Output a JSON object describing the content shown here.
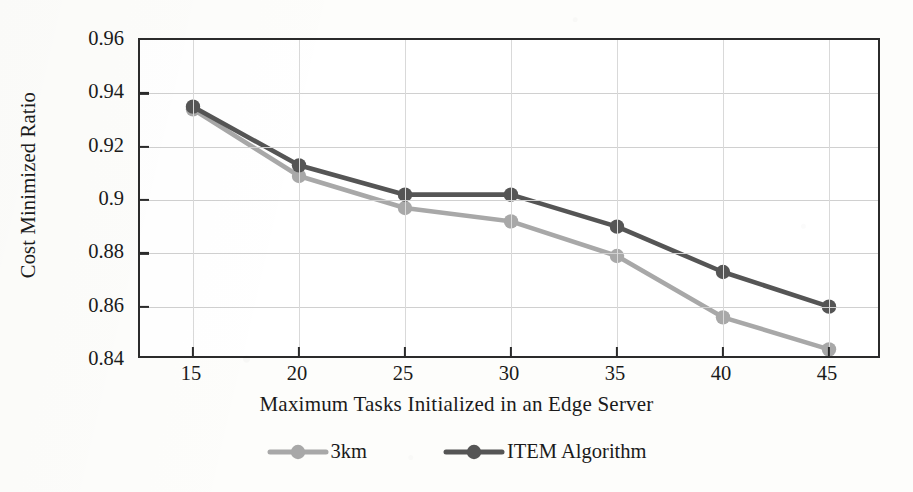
{
  "chart_data": {
    "type": "line",
    "title": "",
    "xlabel": "Maximum Tasks Initialized in an Edge Server",
    "ylabel": "Cost Minimized Ratio",
    "x": [
      15,
      20,
      25,
      30,
      35,
      40,
      45
    ],
    "xticklabels": [
      "15",
      "20",
      "25",
      "30",
      "35",
      "40",
      "45"
    ],
    "yticklabels": [
      "0.84",
      "0.86",
      "0.88",
      "0.9",
      "0.92",
      "0.94",
      "0.96"
    ],
    "yticks": [
      0.84,
      0.86,
      0.88,
      0.9,
      0.92,
      0.94,
      0.96
    ],
    "xlim": [
      12.5,
      47.5
    ],
    "ylim": [
      0.84,
      0.96
    ],
    "grid": "horizontal-and-vertical",
    "legend_position": "below-axis-center",
    "series": [
      {
        "name": "3km",
        "color": "#a8a8a8",
        "marker": "circle",
        "values": [
          0.934,
          0.909,
          0.897,
          0.892,
          0.879,
          0.856,
          0.844
        ]
      },
      {
        "name": "ITEM Algorithm",
        "color": "#555555",
        "marker": "circle",
        "values": [
          0.935,
          0.913,
          0.902,
          0.902,
          0.89,
          0.873,
          0.86
        ]
      }
    ]
  },
  "legend": {
    "items": [
      {
        "label": "3km",
        "color": "#a8a8a8"
      },
      {
        "label": "ITEM Algorithm",
        "color": "#555555"
      }
    ]
  },
  "colors": {
    "series_light": "#a8a8a8",
    "series_dark": "#555555",
    "axis": "#2b2b2b",
    "grid": "#d0d0d0",
    "background": "#fdfdfb",
    "plot_background": "#ffffff"
  }
}
